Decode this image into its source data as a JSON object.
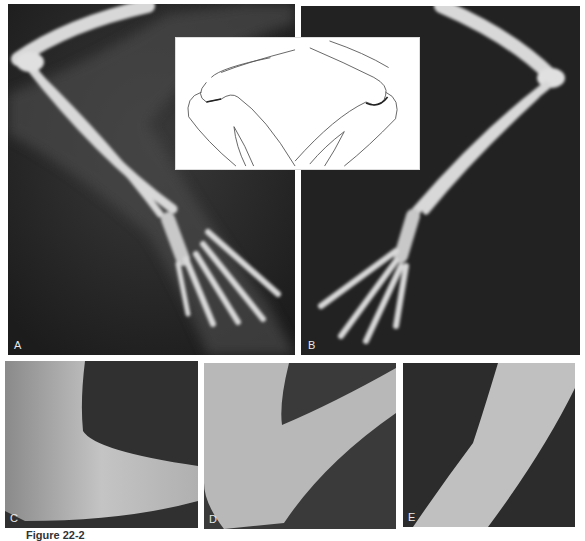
{
  "figure": {
    "panels": [
      {
        "id": "A",
        "label": "A",
        "type": "radiograph"
      },
      {
        "id": "B",
        "label": "B",
        "type": "radiograph"
      },
      {
        "id": "C",
        "label": "C",
        "type": "photograph"
      },
      {
        "id": "D",
        "label": "D",
        "type": "photograph"
      },
      {
        "id": "E",
        "label": "E",
        "type": "photograph"
      }
    ],
    "inset": {
      "type": "line-drawing",
      "subject": "elbow joint articulation"
    },
    "caption": "Figure 22-2"
  }
}
